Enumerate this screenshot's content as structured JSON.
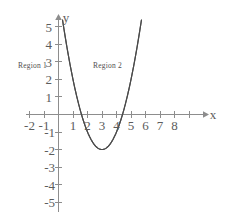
{
  "figure": {
    "background_color": "#ffffff",
    "axis_color": "#8d8d8d",
    "curve_color": "#4a4a4a",
    "text_color": "#5c5c5c"
  },
  "axes": {
    "x_label": "x",
    "y_label": "y",
    "x_ticks": [
      {
        "value": -2,
        "label": "-2"
      },
      {
        "value": -1,
        "label": "-1"
      },
      {
        "value": 1,
        "label": "1"
      },
      {
        "value": 2,
        "label": "2"
      },
      {
        "value": 3,
        "label": "3"
      },
      {
        "value": 4,
        "label": "4"
      },
      {
        "value": 5,
        "label": "5"
      },
      {
        "value": 6,
        "label": "6"
      },
      {
        "value": 7,
        "label": "7"
      },
      {
        "value": 8,
        "label": "8"
      }
    ],
    "y_ticks": [
      {
        "value": 5,
        "label": "5"
      },
      {
        "value": 4,
        "label": "4"
      },
      {
        "value": 3,
        "label": "3"
      },
      {
        "value": 2,
        "label": "2"
      },
      {
        "value": 1,
        "label": "1"
      },
      {
        "value": -1,
        "label": "-1"
      },
      {
        "value": -2,
        "label": "-2"
      },
      {
        "value": -3,
        "label": "-3"
      },
      {
        "value": -4,
        "label": "-4"
      },
      {
        "value": -5,
        "label": "-5"
      }
    ]
  },
  "annotations": [
    {
      "id": "region-1",
      "text": "Region 1",
      "x_px": 18,
      "y_px": 66
    },
    {
      "id": "region-2",
      "text": "Region 2",
      "x_px": 93,
      "y_px": 66
    }
  ],
  "chart_data": {
    "type": "line",
    "title": "",
    "xlabel": "x",
    "ylabel": "y",
    "grid": false,
    "legend": "none",
    "xlim": [
      -2.6,
      8.6
    ],
    "ylim": [
      -5.4,
      5.4
    ],
    "annotations": [
      "Region 1",
      "Region 2"
    ],
    "series": [
      {
        "name": "parabola",
        "equation": "y = (x - 3)^2 - 2",
        "vertex": [
          3,
          -2
        ],
        "roots": [
          1.586,
          4.414
        ],
        "x": [
          0.35,
          0.6,
          0.9,
          1.2,
          1.5,
          1.8,
          2.1,
          2.4,
          2.7,
          3.0,
          3.3,
          3.6,
          3.9,
          4.2,
          4.5,
          4.8,
          5.1,
          5.4,
          5.65
        ],
        "values": [
          5.02,
          3.76,
          2.41,
          1.24,
          0.25,
          -0.56,
          -1.19,
          -1.64,
          -1.91,
          -2.0,
          -1.91,
          -1.64,
          -1.19,
          -0.56,
          0.25,
          1.24,
          2.41,
          3.76,
          5.02
        ]
      }
    ]
  }
}
